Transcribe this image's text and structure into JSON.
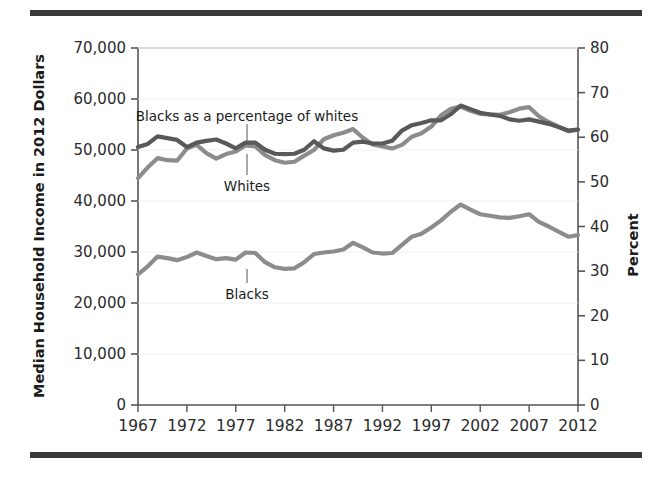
{
  "figure": {
    "rule_color": "#3a3a3a",
    "background": "#ffffff"
  },
  "chart_data": {
    "type": "line",
    "title": "",
    "subtitle": "",
    "xlabel": "",
    "ylabel": "Median Household Income in 2012 Dollars",
    "y2label": "Percent",
    "ylim": [
      0,
      70000
    ],
    "y2lim": [
      0,
      80
    ],
    "xlim": [
      1967,
      2012
    ],
    "grid": false,
    "legend_position": "inline-annotations",
    "xticks": [
      "1967",
      "1972",
      "1977",
      "1982",
      "1987",
      "1992",
      "1997",
      "2002",
      "2007",
      "2012"
    ],
    "xtick_values": [
      1967,
      1972,
      1977,
      1982,
      1987,
      1992,
      1997,
      2002,
      2007,
      2012
    ],
    "yticks": [
      "0",
      "10,000",
      "20,000",
      "30,000",
      "40,000",
      "50,000",
      "60,000",
      "70,000"
    ],
    "ytick_values": [
      0,
      10000,
      20000,
      30000,
      40000,
      50000,
      60000,
      70000
    ],
    "y2ticks": [
      "0",
      "10",
      "20",
      "30",
      "40",
      "50",
      "60",
      "70",
      "80"
    ],
    "y2tick_values": [
      0,
      10,
      20,
      30,
      40,
      50,
      60,
      70,
      80
    ],
    "x": [
      1967,
      1968,
      1969,
      1970,
      1971,
      1972,
      1973,
      1974,
      1975,
      1976,
      1977,
      1978,
      1979,
      1980,
      1981,
      1982,
      1983,
      1984,
      1985,
      1986,
      1987,
      1988,
      1989,
      1990,
      1991,
      1992,
      1993,
      1994,
      1995,
      1996,
      1997,
      1998,
      1999,
      2000,
      2001,
      2002,
      2003,
      2004,
      2005,
      2006,
      2007,
      2008,
      2009,
      2010,
      2011,
      2012
    ],
    "series": [
      {
        "name": "Whites",
        "axis": "left",
        "color": "#8c8c8c",
        "unit": "dollars",
        "values": [
          44500,
          46600,
          48400,
          48000,
          47900,
          50300,
          51000,
          49400,
          48300,
          49200,
          49700,
          50900,
          50700,
          49000,
          48000,
          47500,
          47700,
          48900,
          50000,
          52100,
          52900,
          53400,
          54100,
          52400,
          51100,
          50700,
          50300,
          51000,
          52600,
          53300,
          54600,
          56800,
          58100,
          58500,
          57700,
          57100,
          57000,
          56900,
          57400,
          58100,
          58400,
          56600,
          55500,
          54600,
          53700,
          54000
        ]
      },
      {
        "name": "Blacks",
        "axis": "left",
        "color": "#8c8c8c",
        "unit": "dollars",
        "values": [
          25600,
          27200,
          29100,
          28800,
          28400,
          29000,
          29900,
          29200,
          28600,
          28800,
          28500,
          29900,
          29800,
          28000,
          27000,
          26700,
          26800,
          28000,
          29600,
          29900,
          30100,
          30500,
          31800,
          30900,
          29900,
          29700,
          29800,
          31400,
          33000,
          33600,
          34800,
          36200,
          37900,
          39300,
          38300,
          37400,
          37100,
          36800,
          36700,
          37000,
          37400,
          35900,
          35000,
          34000,
          33000,
          33300
        ]
      },
      {
        "name": "Blacks as a percentage of whites",
        "axis": "right",
        "color": "#595959",
        "unit": "percent",
        "values": [
          57.8,
          58.5,
          60.2,
          59.8,
          59.4,
          57.8,
          58.8,
          59.2,
          59.5,
          58.6,
          57.5,
          58.8,
          58.8,
          57.2,
          56.3,
          56.2,
          56.3,
          57.2,
          59.1,
          57.5,
          57.0,
          57.2,
          58.8,
          59.0,
          58.6,
          58.6,
          59.2,
          61.5,
          62.7,
          63.2,
          63.8,
          63.8,
          65.2,
          67.1,
          66.3,
          65.5,
          65.1,
          64.8,
          64.0,
          63.7,
          64.0,
          63.5,
          63.0,
          62.3,
          61.5,
          61.7
        ]
      }
    ],
    "annotations": [
      {
        "text": "Blacks as a percentage of whites",
        "target_series": "Blacks as a percentage of whites"
      },
      {
        "text": "Whites",
        "target_series": "Whites"
      },
      {
        "text": "Blacks",
        "target_series": "Blacks"
      }
    ]
  }
}
